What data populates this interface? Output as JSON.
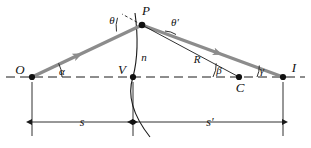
{
  "figure": {
    "type": "optics-refraction-diagram",
    "colors": {
      "ray": "#8c8c8c",
      "line": "#1a1a1a",
      "axis_dash": "#1a1a1a",
      "background": "#ffffff"
    }
  },
  "points": {
    "O": {
      "label": "O",
      "x": 32,
      "y": 77,
      "role": "object-point"
    },
    "P": {
      "label": "P",
      "x": 142,
      "y": 25,
      "role": "refraction-point"
    },
    "V": {
      "label": "V",
      "x": 133,
      "y": 77,
      "role": "vertex"
    },
    "C": {
      "label": "C",
      "x": 239,
      "y": 77,
      "role": "center-of-curvature"
    },
    "I": {
      "label": "I",
      "x": 283,
      "y": 77,
      "role": "image-point"
    }
  },
  "angles": {
    "theta": {
      "label": "θ",
      "x": 112,
      "y": 20,
      "role": "angle-of-incidence"
    },
    "theta_prime": {
      "label": "θ′",
      "x": 172,
      "y": 23,
      "role": "angle-of-refraction"
    },
    "alpha": {
      "label": "α",
      "x": 60,
      "y": 74,
      "role": "object-ray-axis-angle"
    },
    "beta": {
      "label": "β",
      "x": 219,
      "y": 73,
      "role": "radius-axis-angle"
    },
    "gamma": {
      "label": "γ",
      "x": 262,
      "y": 74,
      "role": "image-ray-axis-angle"
    }
  },
  "segments": {
    "n": {
      "label": "n",
      "x": 141,
      "y": 58,
      "role": "refractive-index-surface"
    },
    "R": {
      "label": "R",
      "x": 198,
      "y": 62,
      "role": "radius-of-curvature"
    }
  },
  "dimensions": {
    "s": {
      "label": "s",
      "x": 82,
      "y": 126,
      "from": "O",
      "to": "V",
      "role": "object-distance"
    },
    "s_prime": {
      "label": "s′",
      "x": 210,
      "y": 126,
      "from": "V",
      "to": "I",
      "role": "image-distance"
    }
  }
}
